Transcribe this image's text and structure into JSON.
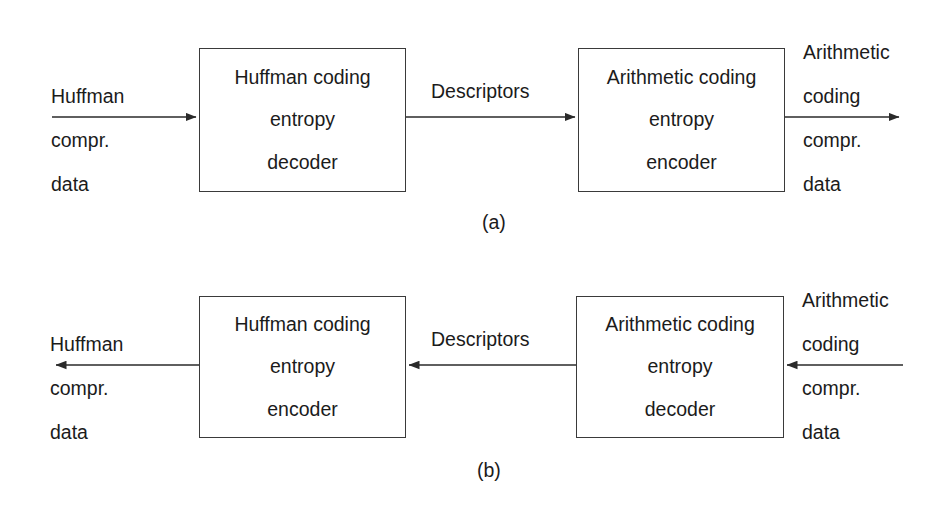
{
  "figure": {
    "background": "#ffffff",
    "line_color": "#3a3a3a",
    "text_color": "#1b1b1b"
  },
  "panels": [
    {
      "caption": "(a)",
      "input_label": {
        "lines": [
          "Huffman",
          "compr.",
          "data"
        ]
      },
      "left_box": {
        "lines": [
          "Huffman coding",
          "entropy",
          "decoder"
        ]
      },
      "middle_label": "Descriptors",
      "right_box": {
        "lines": [
          "Arithmetic coding",
          "entropy",
          "encoder"
        ]
      },
      "output_label": {
        "lines": [
          "Arithmetic",
          "coding",
          "compr.",
          "data"
        ]
      },
      "flow_direction": "left-to-right"
    },
    {
      "caption": "(b)",
      "output_label": {
        "lines": [
          "Huffman",
          "compr.",
          "data"
        ]
      },
      "left_box": {
        "lines": [
          "Huffman coding",
          "entropy",
          "encoder"
        ]
      },
      "middle_label": "Descriptors",
      "right_box": {
        "lines": [
          "Arithmetic coding",
          "entropy",
          "decoder"
        ]
      },
      "input_label": {
        "lines": [
          "Arithmetic",
          "coding",
          "compr.",
          "data"
        ]
      },
      "flow_direction": "right-to-left"
    }
  ]
}
